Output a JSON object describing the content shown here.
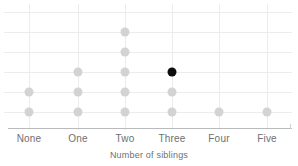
{
  "chart_data": {
    "type": "scatter",
    "title": "",
    "xlabel": "Number of siblings",
    "ylabel": "",
    "categories": [
      "None",
      "One",
      "Two",
      "Three",
      "Four",
      "Five"
    ],
    "values": [
      2,
      3,
      5,
      3,
      1,
      1
    ],
    "grid": true,
    "legend": null,
    "xlim": [
      0,
      6
    ],
    "ylim": [
      0,
      6
    ],
    "highlight": {
      "category": "Three",
      "level": 3,
      "color": "#0d0d0d"
    },
    "dot_color": "#d2d3d5",
    "grid_color": "#ececed",
    "axis_color": "#b9babb",
    "label_color": "#6e7072"
  },
  "axis": {
    "tick_labels": [
      "None",
      "One",
      "Two",
      "Three",
      "Four",
      "Five"
    ],
    "title": "Number of siblings"
  }
}
